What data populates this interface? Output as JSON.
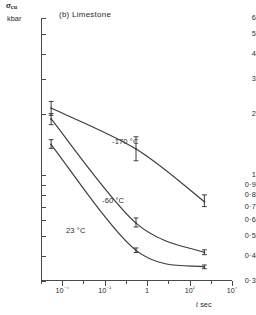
{
  "figure": {
    "panel_title": "(b) Limestone",
    "y_axis_symbol": "σ",
    "y_axis_symbol_sub": "cu",
    "y_axis_unit": "kbar",
    "x_axis_title_var": "t",
    "x_axis_title_unit": "sec"
  },
  "chart_data": {
    "type": "line",
    "title": "(b) Limestone",
    "xlabel": "t sec",
    "ylabel": "σcu kbar",
    "xscale": "log",
    "yscale": "log",
    "xlim": [
      1e-05,
      10000.0
    ],
    "ylim": [
      0.3,
      6
    ],
    "grid": false,
    "legend": "inline annotations on curves",
    "x_ticks": [
      {
        "value": 0.0001,
        "label": "10⁻⁴"
      },
      {
        "value": 0.01,
        "label": "10⁻²"
      },
      {
        "value": 1,
        "label": "1"
      },
      {
        "value": 100.0,
        "label": "10²"
      },
      {
        "value": 10000.0,
        "label": "10⁴"
      }
    ],
    "x_tick_labels": [
      "10-4",
      "10-2",
      "1",
      "102",
      "104"
    ],
    "y_ticks": [
      6,
      5,
      4,
      3,
      2,
      1,
      0.9,
      0.8,
      0.7,
      0.6,
      0.5,
      0.4,
      0.3
    ],
    "y_tick_labels": [
      "6",
      "5",
      "4",
      "3",
      "2",
      "1",
      "0·9",
      "0·8",
      "0·7",
      "0·6",
      "0·5",
      "0·4",
      "0·3"
    ],
    "series": [
      {
        "name": "-170 °C",
        "label": "-170 °C",
        "points": [
          {
            "x": 3e-05,
            "y": 2.15,
            "yerr_low": 1.98,
            "yerr_high": 2.32
          },
          {
            "x": 0.3,
            "y": 1.35,
            "yerr_low": 1.18,
            "yerr_high": 1.55
          },
          {
            "x": 500.0,
            "y": 0.74,
            "yerr_low": 0.7,
            "yerr_high": 0.8
          }
        ]
      },
      {
        "name": "-60 °C",
        "label": "-60 °C",
        "points": [
          {
            "x": 3e-05,
            "y": 1.9,
            "yerr_low": 1.78,
            "yerr_high": 2.02
          },
          {
            "x": 0.3,
            "y": 0.58,
            "yerr_low": 0.555,
            "yerr_high": 0.615
          },
          {
            "x": 500.0,
            "y": 0.415,
            "yerr_low": 0.405,
            "yerr_high": 0.428
          }
        ]
      },
      {
        "name": "23 °C",
        "label": "23 °C",
        "points": [
          {
            "x": 3e-05,
            "y": 1.42,
            "yerr_low": 1.36,
            "yerr_high": 1.5
          },
          {
            "x": 0.3,
            "y": 0.425,
            "yerr_low": 0.415,
            "yerr_high": 0.437
          },
          {
            "x": 500.0,
            "y": 0.352,
            "yerr_low": 0.345,
            "yerr_high": 0.36
          }
        ]
      }
    ],
    "annotations": [
      {
        "text": "-170 °C",
        "x_px": 112,
        "y_px": 138
      },
      {
        "text": "-60 °C",
        "x_px": 102,
        "y_px": 197
      },
      {
        "text": "23 °C",
        "x_px": 66,
        "y_px": 227
      }
    ]
  }
}
